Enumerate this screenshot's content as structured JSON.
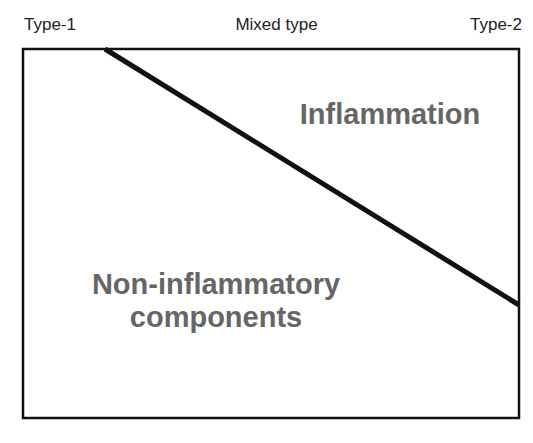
{
  "diagram": {
    "top_labels": {
      "left": "Type-1",
      "middle": "Mixed type",
      "right": "Type-2"
    },
    "regions": {
      "upper_right": "Inflammation",
      "lower_left_line1": "Non-inflammatory",
      "lower_left_line2": "components"
    },
    "colors": {
      "border": "#111111",
      "region_text": "#666666",
      "label_text": "#222222"
    }
  }
}
